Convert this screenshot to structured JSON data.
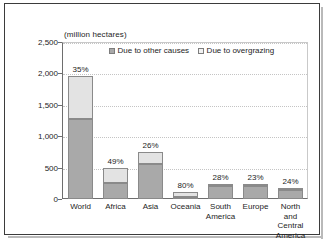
{
  "figure": {
    "units_label": "(million hectares)"
  },
  "legend": {
    "position": "top-inside",
    "entries": [
      {
        "label": "Due to other causes",
        "swatch": "legend-swatch-other",
        "color": "#a9a9a9"
      },
      {
        "label": "Due to overgrazing",
        "swatch": "legend-swatch-overgrazing",
        "color": "#f2f2f2"
      }
    ]
  },
  "chart_data": {
    "type": "bar",
    "stacked": true,
    "title": "",
    "subtitle": "",
    "xlabel": "",
    "ylabel": "(million hectares)",
    "ylim": [
      0,
      2500
    ],
    "ytick_labels": [
      "0",
      "500",
      "1,000",
      "1,500",
      "2,000",
      "2,500"
    ],
    "ytick_values": [
      0,
      500,
      1000,
      1500,
      2000,
      2500
    ],
    "grid": true,
    "categories": [
      "World",
      "Africa",
      "Asia",
      "Oceania",
      "South America",
      "Europe",
      "North and Central America"
    ],
    "series": [
      {
        "name": "Due to other causes",
        "color": "#a9a9a9",
        "values": [
          1280,
          255,
          555,
          25,
          200,
          215,
          145
        ]
      },
      {
        "name": "Due to overgrazing",
        "color": "#e3e3e3",
        "values": [
          685,
          245,
          200,
          80,
          45,
          25,
          35
        ]
      }
    ],
    "totals": [
      1965,
      500,
      755,
      105,
      245,
      240,
      180
    ],
    "annotations": [
      {
        "category": "World",
        "text": "35%"
      },
      {
        "category": "Africa",
        "text": "49%"
      },
      {
        "category": "Asia",
        "text": "26%"
      },
      {
        "category": "Oceania",
        "text": "80%"
      },
      {
        "category": "South America",
        "text": "28%"
      },
      {
        "category": "Europe",
        "text": "23%"
      },
      {
        "category": "North and Central America",
        "text": "24%"
      }
    ]
  },
  "x_labels": [
    "World",
    "Africa",
    "Asia",
    "Oceania",
    "South\nAmerica",
    "Europe",
    "North and\nCentral\nAmerica"
  ]
}
